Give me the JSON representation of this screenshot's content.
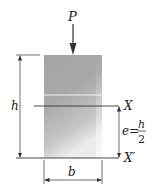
{
  "diagram": {
    "load_label": "P",
    "height_label": "h",
    "width_label": "b",
    "axis_label": "X",
    "base_axis_label": "X′",
    "eccentricity": {
      "variable": "e",
      "equals": "=",
      "numerator": "h",
      "denominator": "2"
    },
    "colors": {
      "block_top": "#a4a4a4",
      "block_bottom": "#e8e8e8",
      "lines": "#333333",
      "text": "#222222"
    }
  }
}
